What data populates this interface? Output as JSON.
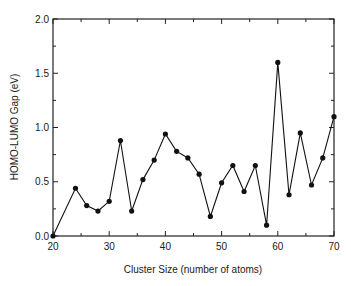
{
  "chart_data": {
    "type": "line",
    "title": "",
    "xlabel": "Cluster Size (number of atoms)",
    "ylabel": "HOMO-LUMO Gap (eV)",
    "xlim": [
      20,
      70
    ],
    "ylim": [
      0.0,
      2.0
    ],
    "xticks": [
      "20",
      "30",
      "40",
      "50",
      "60",
      "70"
    ],
    "yticks": [
      "0.0",
      "0.5",
      "1.0",
      "1.5",
      "2.0"
    ],
    "x_minor_step": 5,
    "y_minor_step": 0.25,
    "grid": false,
    "legend": null,
    "markers": "filled-circle",
    "series": [
      {
        "name": "HOMO-LUMO Gap",
        "x": [
          20,
          24,
          26,
          28,
          30,
          32,
          34,
          36,
          38,
          40,
          42,
          44,
          46,
          48,
          50,
          52,
          54,
          56,
          58,
          60,
          62,
          64,
          66,
          68,
          70
        ],
        "y": [
          0.0,
          0.44,
          0.28,
          0.23,
          0.32,
          0.88,
          0.23,
          0.52,
          0.7,
          0.94,
          0.78,
          0.72,
          0.57,
          0.18,
          0.49,
          0.65,
          0.41,
          0.65,
          0.1,
          1.6,
          0.38,
          0.95,
          0.47,
          0.72,
          1.1
        ]
      }
    ]
  }
}
